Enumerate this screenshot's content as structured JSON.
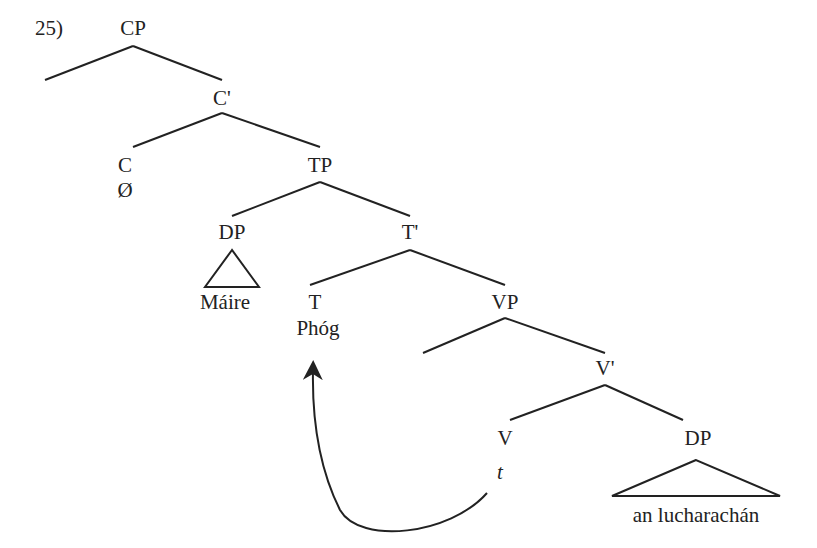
{
  "example_number": "25)",
  "nodes": {
    "cp": "CP",
    "c_bar": "C'",
    "c": "C",
    "c_null": "Ø",
    "tp": "TP",
    "dp_subj": "DP",
    "subj": "Máire",
    "t_bar": "T'",
    "t": "T",
    "t_verb": "Phóg",
    "vp": "VP",
    "v_bar": "V'",
    "v": "V",
    "v_trace": "t",
    "dp_obj": "DP",
    "obj": "an lucharachán"
  },
  "movement": {
    "from": "v_trace",
    "to": "t_verb",
    "type": "head-movement"
  }
}
